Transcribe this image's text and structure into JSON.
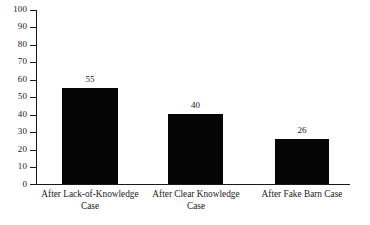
{
  "chart_data": {
    "type": "bar",
    "title": "",
    "subtitle": "",
    "xlabel": "",
    "ylabel": "",
    "categories": [
      "After Lack-of-Knowledge Case",
      "After Clear Knowledge Case",
      "After Fake Barn Case"
    ],
    "category_lines": [
      [
        "After Lack-of-Knowledge",
        "Case"
      ],
      [
        "After Clear Knowledge",
        "Case"
      ],
      [
        "After Fake Barn Case",
        ""
      ]
    ],
    "values": [
      55,
      40,
      26
    ],
    "value_labels": [
      "55",
      "40",
      "26"
    ],
    "ylim": [
      0,
      100
    ],
    "ytick_labels": [
      "100",
      "90",
      "80",
      "70",
      "60",
      "50",
      "40",
      "30",
      "20",
      "10",
      "0"
    ],
    "ytick_values": [
      100,
      90,
      80,
      70,
      60,
      50,
      40,
      30,
      20,
      10,
      0
    ],
    "grid": false,
    "legend": null,
    "colors": {
      "bar": "#050505",
      "axis": "#1a1a1a",
      "text": "#1a1a1a",
      "background": "#ffffff"
    }
  }
}
